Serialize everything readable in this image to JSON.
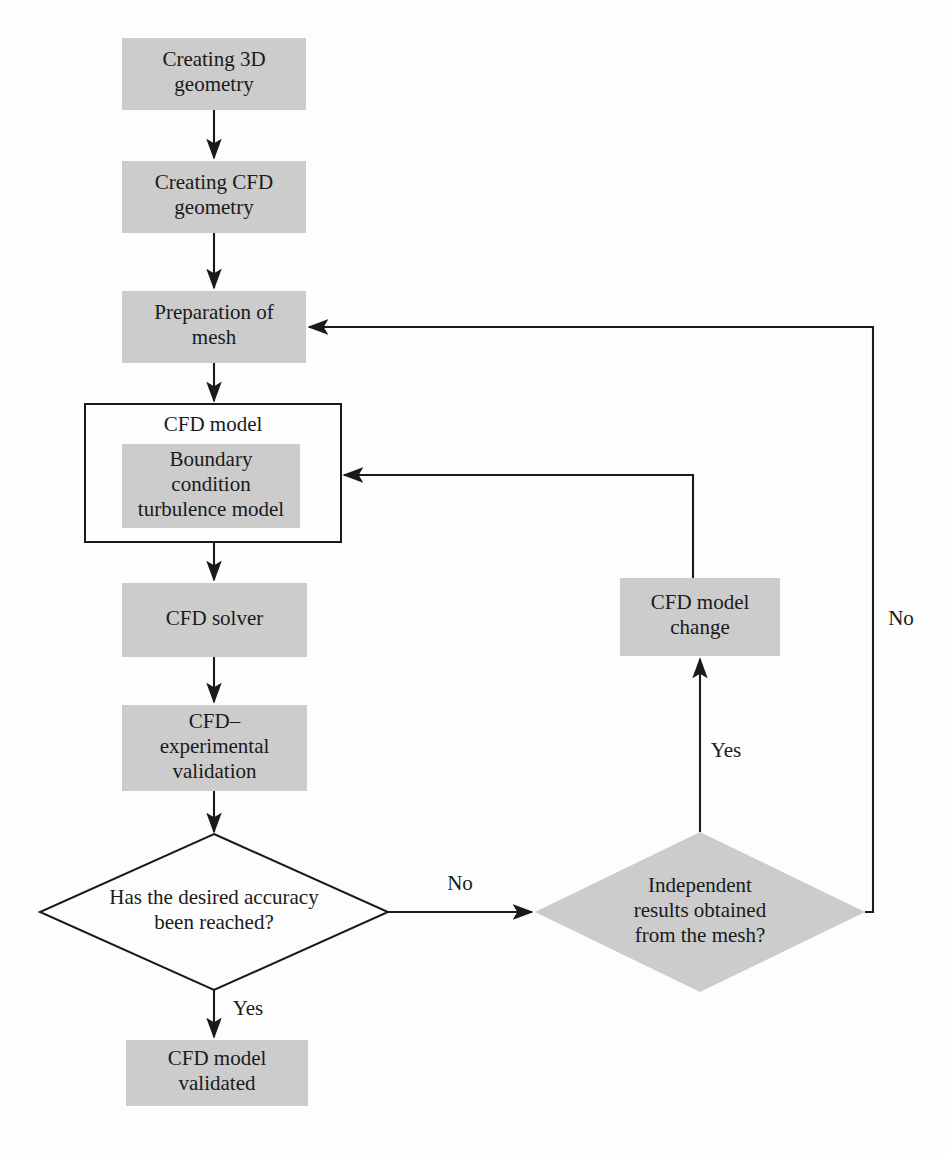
{
  "figure": {
    "type": "flowchart",
    "width": 946,
    "height": 1153,
    "colors": {
      "node_fill": "#cccccc",
      "stroke": "#1a1a1a",
      "background": "#fdfdfd",
      "outline_fill": "#fdfdfd"
    }
  },
  "nodes": [
    {
      "id": "creating-3d-geometry",
      "shape": "rect",
      "style": "filled",
      "lines": [
        "Creating 3D",
        "geometry"
      ],
      "x": 122,
      "y": 38,
      "w": 184,
      "h": 72
    },
    {
      "id": "creating-cfd-geometry",
      "shape": "rect",
      "style": "filled",
      "lines": [
        "Creating CFD",
        "geometry"
      ],
      "x": 122,
      "y": 161,
      "w": 184,
      "h": 72
    },
    {
      "id": "preparation-of-mesh",
      "shape": "rect",
      "style": "filled",
      "lines": [
        "Preparation of",
        "mesh"
      ],
      "x": 122,
      "y": 291,
      "w": 184,
      "h": 72
    },
    {
      "id": "cfd-model-group",
      "shape": "rect",
      "style": "outline",
      "lines": [
        "CFD model"
      ],
      "label_position": "top",
      "x": 85,
      "y": 404,
      "w": 256,
      "h": 138
    },
    {
      "id": "boundary-condition-turbulence-model",
      "shape": "rect",
      "style": "filled",
      "lines": [
        "Boundary",
        "condition",
        "turbulence model"
      ],
      "x": 122,
      "y": 444,
      "w": 178,
      "h": 84
    },
    {
      "id": "cfd-solver",
      "shape": "rect",
      "style": "filled",
      "lines": [
        "CFD solver"
      ],
      "x": 122,
      "y": 583,
      "w": 185,
      "h": 74
    },
    {
      "id": "cfd-experimental-validation",
      "shape": "rect",
      "style": "filled",
      "lines": [
        "CFD–",
        "experimental",
        "validation"
      ],
      "x": 122,
      "y": 705,
      "w": 185,
      "h": 86
    },
    {
      "id": "has-the-desired-accuracy-been-reached",
      "shape": "diamond",
      "style": "outline",
      "lines": [
        "Has the desired accuracy",
        "been reached?"
      ],
      "cx": 214,
      "cy": 912,
      "rx": 174,
      "ry": 78
    },
    {
      "id": "independent-results-obtained-from-the-mesh",
      "shape": "diamond",
      "style": "filled",
      "lines": [
        "Independent",
        "results obtained",
        "from the mesh?"
      ],
      "cx": 700,
      "cy": 912,
      "rx": 165,
      "ry": 80
    },
    {
      "id": "cfd-model-change",
      "shape": "rect",
      "style": "filled",
      "lines": [
        "CFD model",
        "change"
      ],
      "x": 620,
      "y": 578,
      "w": 160,
      "h": 78
    },
    {
      "id": "cfd-model-validated",
      "shape": "rect",
      "style": "filled",
      "lines": [
        "CFD model",
        "validated"
      ],
      "x": 126,
      "y": 1040,
      "w": 182,
      "h": 66
    }
  ],
  "edges": [
    {
      "id": "e-3d-to-cfd-geometry",
      "from": "creating-3d-geometry",
      "to": "creating-cfd-geometry",
      "points": "214,110 214,158",
      "arrow": "end",
      "label": ""
    },
    {
      "id": "e-cfd-geometry-to-mesh",
      "from": "creating-cfd-geometry",
      "to": "preparation-of-mesh",
      "points": "214,233 214,288",
      "arrow": "end",
      "label": ""
    },
    {
      "id": "e-mesh-to-cfd-model",
      "from": "preparation-of-mesh",
      "to": "cfd-model-group",
      "points": "214,363 214,401",
      "arrow": "end",
      "label": ""
    },
    {
      "id": "e-cfd-model-to-solver",
      "from": "cfd-model-group",
      "to": "cfd-solver",
      "points": "214,542 214,580",
      "arrow": "end",
      "label": ""
    },
    {
      "id": "e-solver-to-validation",
      "from": "cfd-solver",
      "to": "cfd-experimental-validation",
      "points": "214,657 214,702",
      "arrow": "end",
      "label": ""
    },
    {
      "id": "e-validation-to-accuracy",
      "from": "cfd-experimental-validation",
      "to": "has-the-desired-accuracy-been-reached",
      "points": "214,791 214,832",
      "arrow": "end",
      "label": ""
    },
    {
      "id": "e-accuracy-no-to-independent",
      "from": "has-the-desired-accuracy-been-reached",
      "to": "independent-results-obtained-from-the-mesh",
      "points": "388,912 532,912",
      "arrow": "end",
      "label": "No",
      "label_x": 460,
      "label_y": 885
    },
    {
      "id": "e-accuracy-yes-to-validated",
      "from": "has-the-desired-accuracy-been-reached",
      "to": "cfd-model-validated",
      "points": "214,990 214,1037",
      "arrow": "end",
      "label": "Yes",
      "label_x": 248,
      "label_y": 1010
    },
    {
      "id": "e-independent-yes-to-cfd-model-change",
      "from": "independent-results-obtained-from-the-mesh",
      "to": "cfd-model-change",
      "points": "700,832 700,659",
      "arrow": "end",
      "label": "Yes",
      "label_x": 726,
      "label_y": 752
    },
    {
      "id": "e-cfd-model-change-to-cfd-model",
      "from": "cfd-model-change",
      "to": "cfd-model-group",
      "points": "693,578 693,475 344,475",
      "arrow": "end",
      "label": ""
    },
    {
      "id": "e-independent-no-to-mesh",
      "from": "independent-results-obtained-from-the-mesh",
      "to": "preparation-of-mesh",
      "points": "865,912 873,912 873,327 309,327",
      "arrow": "end",
      "label": "No",
      "label_x": 901,
      "label_y": 620
    }
  ]
}
